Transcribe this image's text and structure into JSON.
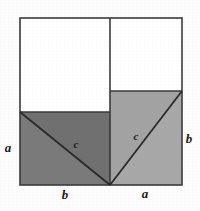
{
  "figure": {
    "colors": {
      "background": "#fdfdfd",
      "stroke": "#3a3a3a",
      "dark_region": "#7a7a7a",
      "light_region": "#a8a8a8",
      "white_region": "#ffffff",
      "label": "#1a1a1a"
    },
    "geometry": {
      "outer_square": {
        "x": 20,
        "y": 18,
        "width": 162,
        "height": 167
      },
      "vertical_divider_x": 110,
      "left_region_top_y": 112,
      "right_region_top_y": 91,
      "left_diagonal": {
        "x1": 20,
        "y1": 112,
        "x2": 110,
        "y2": 185
      },
      "right_diagonal": {
        "x1": 110,
        "y1": 185,
        "x2": 182,
        "y2": 91
      }
    },
    "labels": [
      {
        "id": "left-side-a",
        "text": "a",
        "x": 10,
        "y": 152
      },
      {
        "id": "bottom-left-b",
        "text": "b",
        "x": 63,
        "y": 198
      },
      {
        "id": "bottom-right-a",
        "text": "a",
        "x": 142,
        "y": 197
      },
      {
        "id": "right-side-b",
        "text": "b",
        "x": 185,
        "y": 143
      },
      {
        "id": "left-hypotenuse-c",
        "text": "c",
        "x": 72,
        "y": 149
      },
      {
        "id": "right-hypotenuse-c",
        "text": "c",
        "x": 133,
        "y": 141
      }
    ]
  }
}
